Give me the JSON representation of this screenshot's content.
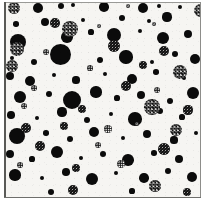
{
  "figure": {
    "kind": "particle-field-micrograph",
    "width": 208,
    "height": 207,
    "background_color": "#ffffff",
    "plate_background_color": "#f6f5f2",
    "solid_particle_color": "#0b0b0b",
    "dither_particle_color": "#1a1a1a",
    "frame": {
      "left_rule_color": "#5a5a57",
      "top_rule_color": "#9a9a97",
      "right_rule_color": "#8d8d8a",
      "bottom_rule_color": "#6e6e6b"
    }
  },
  "chart_data": {
    "type": "scatter",
    "title": "",
    "subtitle": "",
    "xlabel": "",
    "ylabel": "",
    "xlim": [
      0,
      197
    ],
    "ylim": [
      0,
      196
    ],
    "grid": false,
    "legend": null,
    "annotations": [],
    "tick_labels": {
      "x": [],
      "y": []
    },
    "series": [
      {
        "name": "solid-particles",
        "fill": "solid",
        "color": "#0b0b0b",
        "count": 78,
        "points": [
          {
            "x": 34,
            "y": 6,
            "r": 5.0
          },
          {
            "x": 57,
            "y": 4,
            "r": 3.2
          },
          {
            "x": 69,
            "y": 3,
            "r": 2.1
          },
          {
            "x": 100,
            "y": 5,
            "r": 4.8
          },
          {
            "x": 139,
            "y": 6,
            "r": 5.4
          },
          {
            "x": 155,
            "y": 4,
            "r": 2.4
          },
          {
            "x": 176,
            "y": 5,
            "r": 2.0
          },
          {
            "x": 12,
            "y": 22,
            "r": 2.8
          },
          {
            "x": 41,
            "y": 20,
            "r": 4.0
          },
          {
            "x": 79,
            "y": 18,
            "r": 2.2
          },
          {
            "x": 118,
            "y": 16,
            "r": 3.0
          },
          {
            "x": 145,
            "y": 19,
            "r": 2.0
          },
          {
            "x": 163,
            "y": 15,
            "r": 4.6
          },
          {
            "x": 14,
            "y": 40,
            "r": 8.0
          },
          {
            "x": 63,
            "y": 35,
            "r": 5.8
          },
          {
            "x": 87,
            "y": 30,
            "r": 2.6
          },
          {
            "x": 110,
            "y": 33,
            "r": 7.0
          },
          {
            "x": 136,
            "y": 29,
            "r": 2.3
          },
          {
            "x": 159,
            "y": 36,
            "r": 6.2
          },
          {
            "x": 184,
            "y": 32,
            "r": 4.4
          },
          {
            "x": 8,
            "y": 56,
            "r": 2.4
          },
          {
            "x": 30,
            "y": 60,
            "r": 3.0
          },
          {
            "x": 56,
            "y": 52,
            "r": 10.5
          },
          {
            "x": 96,
            "y": 58,
            "r": 3.4
          },
          {
            "x": 122,
            "y": 55,
            "r": 6.6
          },
          {
            "x": 148,
            "y": 60,
            "r": 2.2
          },
          {
            "x": 171,
            "y": 52,
            "r": 3.0
          },
          {
            "x": 191,
            "y": 57,
            "r": 5.2
          },
          {
            "x": 6,
            "y": 74,
            "r": 4.2
          },
          {
            "x": 26,
            "y": 79,
            "r": 5.4
          },
          {
            "x": 50,
            "y": 73,
            "r": 2.0
          },
          {
            "x": 72,
            "y": 78,
            "r": 3.6
          },
          {
            "x": 101,
            "y": 72,
            "r": 2.1
          },
          {
            "x": 128,
            "y": 77,
            "r": 5.0
          },
          {
            "x": 152,
            "y": 70,
            "r": 2.8
          },
          {
            "x": 180,
            "y": 76,
            "r": 2.3
          },
          {
            "x": 16,
            "y": 95,
            "r": 6.4
          },
          {
            "x": 45,
            "y": 92,
            "r": 3.2
          },
          {
            "x": 68,
            "y": 98,
            "r": 9.0
          },
          {
            "x": 92,
            "y": 90,
            "r": 5.6
          },
          {
            "x": 113,
            "y": 96,
            "r": 2.6
          },
          {
            "x": 137,
            "y": 93,
            "r": 4.0
          },
          {
            "x": 166,
            "y": 99,
            "r": 3.0
          },
          {
            "x": 189,
            "y": 91,
            "r": 6.0
          },
          {
            "x": 7,
            "y": 113,
            "r": 3.8
          },
          {
            "x": 33,
            "y": 116,
            "r": 2.4
          },
          {
            "x": 58,
            "y": 110,
            "r": 4.6
          },
          {
            "x": 83,
            "y": 118,
            "r": 3.2
          },
          {
            "x": 107,
            "y": 112,
            "r": 2.0
          },
          {
            "x": 131,
            "y": 117,
            "r": 6.8
          },
          {
            "x": 156,
            "y": 109,
            "r": 3.4
          },
          {
            "x": 178,
            "y": 115,
            "r": 2.6
          },
          {
            "x": 13,
            "y": 134,
            "r": 8.4
          },
          {
            "x": 42,
            "y": 131,
            "r": 2.8
          },
          {
            "x": 66,
            "y": 137,
            "r": 3.0
          },
          {
            "x": 90,
            "y": 130,
            "r": 5.2
          },
          {
            "x": 119,
            "y": 136,
            "r": 2.2
          },
          {
            "x": 143,
            "y": 132,
            "r": 4.4
          },
          {
            "x": 170,
            "y": 138,
            "r": 3.6
          },
          {
            "x": 192,
            "y": 131,
            "r": 2.4
          },
          {
            "x": 6,
            "y": 152,
            "r": 4.0
          },
          {
            "x": 28,
            "y": 157,
            "r": 2.6
          },
          {
            "x": 53,
            "y": 150,
            "r": 6.0
          },
          {
            "x": 77,
            "y": 156,
            "r": 2.0
          },
          {
            "x": 99,
            "y": 152,
            "r": 3.4
          },
          {
            "x": 124,
            "y": 158,
            "r": 5.8
          },
          {
            "x": 150,
            "y": 151,
            "r": 2.8
          },
          {
            "x": 175,
            "y": 157,
            "r": 4.2
          },
          {
            "x": 11,
            "y": 173,
            "r": 5.6
          },
          {
            "x": 38,
            "y": 176,
            "r": 2.2
          },
          {
            "x": 62,
            "y": 170,
            "r": 3.8
          },
          {
            "x": 88,
            "y": 177,
            "r": 6.4
          },
          {
            "x": 112,
            "y": 171,
            "r": 2.4
          },
          {
            "x": 140,
            "y": 176,
            "r": 4.8
          },
          {
            "x": 164,
            "y": 169,
            "r": 3.0
          },
          {
            "x": 188,
            "y": 175,
            "r": 5.0
          },
          {
            "x": 47,
            "y": 190,
            "r": 3.2
          },
          {
            "x": 128,
            "y": 189,
            "r": 2.6
          }
        ]
      },
      {
        "name": "halftone-particles",
        "fill": "dithered",
        "color": "#1a1a1a",
        "count": 34,
        "points": [
          {
            "x": 10,
            "y": 6,
            "r": 6.0,
            "texture": "coarse"
          },
          {
            "x": 124,
            "y": 4,
            "r": 2.2,
            "texture": "fine"
          },
          {
            "x": 196,
            "y": 8,
            "r": 6.5,
            "texture": "coarse"
          },
          {
            "x": 51,
            "y": 21,
            "r": 4.8,
            "texture": "normal"
          },
          {
            "x": 95,
            "y": 24,
            "r": 2.0,
            "texture": "fine"
          },
          {
            "x": 150,
            "y": 22,
            "r": 2.4,
            "texture": "fine"
          },
          {
            "x": 66,
            "y": 27,
            "r": 8.2,
            "texture": "coarse"
          },
          {
            "x": 110,
            "y": 44,
            "r": 6.0,
            "texture": "normal"
          },
          {
            "x": 13,
            "y": 47,
            "r": 7.0,
            "texture": "coarse"
          },
          {
            "x": 42,
            "y": 50,
            "r": 3.4,
            "texture": "fine"
          },
          {
            "x": 160,
            "y": 49,
            "r": 5.2,
            "texture": "normal"
          },
          {
            "x": 8,
            "y": 64,
            "r": 6.4,
            "texture": "coarse"
          },
          {
            "x": 86,
            "y": 66,
            "r": 2.6,
            "texture": "fine"
          },
          {
            "x": 139,
            "y": 63,
            "r": 4.4,
            "texture": "normal"
          },
          {
            "x": 176,
            "y": 70,
            "r": 7.4,
            "texture": "coarse"
          },
          {
            "x": 30,
            "y": 86,
            "r": 2.8,
            "texture": "fine"
          },
          {
            "x": 122,
            "y": 84,
            "r": 5.0,
            "texture": "normal"
          },
          {
            "x": 153,
            "y": 88,
            "r": 3.0,
            "texture": "fine"
          },
          {
            "x": 20,
            "y": 104,
            "r": 3.2,
            "texture": "fine"
          },
          {
            "x": 78,
            "y": 107,
            "r": 4.2,
            "texture": "normal"
          },
          {
            "x": 148,
            "y": 105,
            "r": 7.8,
            "texture": "coarse"
          },
          {
            "x": 184,
            "y": 108,
            "r": 4.6,
            "texture": "normal"
          },
          {
            "x": 22,
            "y": 126,
            "r": 5.0,
            "texture": "normal"
          },
          {
            "x": 60,
            "y": 124,
            "r": 4.0,
            "texture": "normal"
          },
          {
            "x": 104,
            "y": 127,
            "r": 3.6,
            "texture": "fine"
          },
          {
            "x": 133,
            "y": 122,
            "r": 2.4,
            "texture": "fine"
          },
          {
            "x": 172,
            "y": 128,
            "r": 6.2,
            "texture": "coarse"
          },
          {
            "x": 36,
            "y": 144,
            "r": 5.4,
            "texture": "normal"
          },
          {
            "x": 94,
            "y": 143,
            "r": 3.0,
            "texture": "fine"
          },
          {
            "x": 160,
            "y": 147,
            "r": 5.8,
            "texture": "normal"
          },
          {
            "x": 16,
            "y": 163,
            "r": 2.8,
            "texture": "fine"
          },
          {
            "x": 72,
            "y": 166,
            "r": 4.4,
            "texture": "normal"
          },
          {
            "x": 117,
            "y": 162,
            "r": 3.8,
            "texture": "fine"
          },
          {
            "x": 151,
            "y": 184,
            "r": 5.6,
            "texture": "coarse"
          },
          {
            "x": 69,
            "y": 188,
            "r": 5.0,
            "texture": "normal"
          },
          {
            "x": 183,
            "y": 190,
            "r": 4.2,
            "texture": "normal"
          }
        ]
      }
    ]
  }
}
